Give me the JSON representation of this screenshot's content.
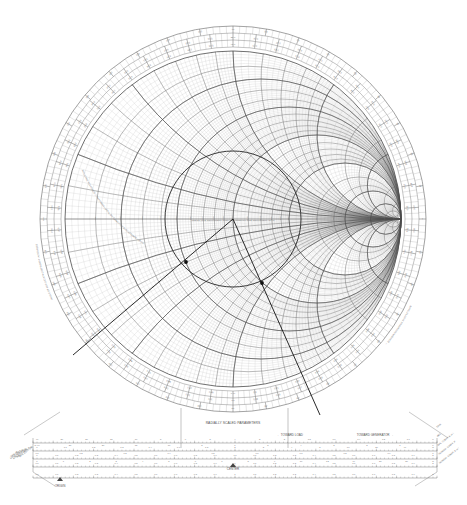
{
  "document": {
    "title": "Smith Chart",
    "kind": "impedance-admittance-smith-chart"
  },
  "chart": {
    "center_x": 233,
    "center_y": 219,
    "radius": 168,
    "outer_radius": 198,
    "name_left": "IMPEDANCE OR ADMITTANCE COORDINATES",
    "resistance_label": "RESISTANCE COMPONENT (R/Zo), OR CONDUCTANCE COMPONENT (G/Yo)",
    "reactance_label": "INDUCTIVE REACTANCE COMPONENT (+jX/Zo), OR CAPACITIVE SUSCEPTANCE (+jB/Yo)",
    "resistance_circles": [
      0.1,
      0.2,
      0.3,
      0.4,
      0.5,
      0.6,
      0.7,
      0.8,
      0.9,
      1.0,
      1.2,
      1.4,
      1.6,
      1.8,
      2.0,
      3.0,
      4.0,
      5.0,
      10.0,
      20.0,
      50.0
    ],
    "resistance_major": [
      0.2,
      0.5,
      1.0,
      2.0,
      5.0,
      10.0
    ],
    "reactance_arcs": [
      0.1,
      0.2,
      0.3,
      0.4,
      0.5,
      0.6,
      0.7,
      0.8,
      0.9,
      1.0,
      1.2,
      1.4,
      1.6,
      1.8,
      2.0,
      3.0,
      4.0,
      5.0,
      10.0,
      20.0,
      50.0
    ],
    "reactance_major": [
      0.2,
      0.5,
      1.0,
      2.0,
      5.0
    ],
    "axis_labels": [
      "0.1",
      "0.2",
      "0.3",
      "0.4",
      "0.5",
      "0.6",
      "0.7",
      "0.8",
      "0.9",
      "1.0",
      "1.2",
      "1.4",
      "1.6",
      "1.8",
      "2.0",
      "3.0",
      "4.0",
      "5.0",
      "10",
      "20",
      "50"
    ],
    "reactance_tick_labels": [
      "0.1",
      "0.2",
      "0.3",
      "0.4",
      "0.5",
      "0.6",
      "0.7",
      "0.8",
      "0.9",
      "1.0",
      "1.2",
      "1.4",
      "1.6",
      "1.8",
      "2.0",
      "3.0",
      "4.0",
      "5.0",
      "10",
      "20",
      "50"
    ]
  },
  "outer_rings": [
    {
      "name": "wavelengths-toward-generator",
      "label": "WAVELENGTHS TOWARD GENERATOR →",
      "range_min": 0.0,
      "range_max": 0.5,
      "major_step": 0.01,
      "labels": [
        "0.0",
        "0.01",
        "0.02",
        "0.03",
        "0.04",
        "0.05",
        "0.06",
        "0.07",
        "0.08",
        "0.09",
        "0.10",
        "0.11",
        "0.12",
        "0.13",
        "0.14",
        "0.15",
        "0.16",
        "0.17",
        "0.18",
        "0.19",
        "0.20",
        "0.21",
        "0.22",
        "0.23",
        "0.24",
        "0.25",
        "0.26",
        "0.27",
        "0.28",
        "0.29",
        "0.30",
        "0.31",
        "0.32",
        "0.33",
        "0.34",
        "0.35",
        "0.36",
        "0.37",
        "0.38",
        "0.39",
        "0.40",
        "0.41",
        "0.42",
        "0.43",
        "0.44",
        "0.45",
        "0.46",
        "0.47",
        "0.48",
        "0.49"
      ]
    },
    {
      "name": "wavelengths-toward-load",
      "label": "← WAVELENGTHS TOWARD LOAD",
      "range_min": 0.0,
      "range_max": 0.5,
      "major_step": 0.01,
      "labels": [
        "0.49",
        "0.48",
        "0.47",
        "0.46",
        "0.45",
        "0.44",
        "0.43",
        "0.42",
        "0.41",
        "0.40",
        "0.39",
        "0.38",
        "0.37",
        "0.36",
        "0.35",
        "0.34",
        "0.33",
        "0.32",
        "0.31",
        "0.30",
        "0.29",
        "0.28",
        "0.27",
        "0.26",
        "0.25",
        "0.24",
        "0.23",
        "0.22",
        "0.21",
        "0.20",
        "0.19",
        "0.18",
        "0.17",
        "0.16",
        "0.15",
        "0.14",
        "0.13",
        "0.12",
        "0.11",
        "0.10",
        "0.09",
        "0.08",
        "0.07",
        "0.06",
        "0.05",
        "0.04",
        "0.03",
        "0.02",
        "0.01",
        "0.0"
      ]
    },
    {
      "name": "angle-of-reflection-coefficient",
      "label": "ANGLE OF REFLECTION COEFFICIENT IN DEGREES",
      "range_min": -180,
      "range_max": 180,
      "major_step": 10,
      "labels": [
        "0",
        "10",
        "20",
        "30",
        "40",
        "50",
        "60",
        "70",
        "80",
        "90",
        "100",
        "110",
        "120",
        "130",
        "140",
        "150",
        "160",
        "170",
        "180",
        "-170",
        "-160",
        "-150",
        "-140",
        "-130",
        "-120",
        "-110",
        "-100",
        "-90",
        "-80",
        "-70",
        "-60",
        "-50",
        "-40",
        "-30",
        "-20",
        "-10"
      ]
    },
    {
      "name": "angle-of-transmission-coefficient",
      "label": "ANGLE OF TRANSMISSION COEFFICIENT IN DEGREES",
      "range_min": -180,
      "range_max": 180,
      "major_step": 10,
      "labels": [
        "0",
        "10",
        "20",
        "30",
        "40",
        "50",
        "60",
        "70",
        "80",
        "90",
        "100",
        "110",
        "120",
        "130",
        "140",
        "150",
        "160",
        "170",
        "180",
        "-170",
        "-160",
        "-150",
        "-140",
        "-130",
        "-120",
        "-110",
        "-100",
        "-90",
        "-80",
        "-70",
        "-60",
        "-50",
        "-40",
        "-30",
        "-20",
        "-10"
      ]
    }
  ],
  "radial_scales": {
    "title": "RADIALLY SCALED PARAMETERS",
    "toward_load": "← TOWARD LOAD",
    "toward_generator": "TOWARD GENERATOR →",
    "center_label": "CENTER",
    "origin_label": "ORIGIN",
    "left_labels": [
      "SWR dB",
      "LOSS COEF",
      "ATTEN [dB]",
      "RTN. LOSS [dB]",
      "RFL. COEFF, P",
      "RFL. LOSS [dB]"
    ],
    "right_labels": [
      "SWR",
      "dBS",
      "RFL. COEFF, E or I",
      "TRANSM. COEFF, P",
      "TRANSM. COEFF, E or I"
    ],
    "rows": [
      {
        "name": "swr-db-row",
        "left_tag": "← SWR dB",
        "ticks": [
          "40",
          "30",
          "20",
          "15",
          "10",
          "8",
          "6",
          "5",
          "4",
          "3",
          "2",
          "1.8",
          "1.6",
          "1.4",
          "1.2",
          "1.1",
          "1"
        ],
        "ticks2": [
          "∞ 40",
          "30",
          "20",
          "15",
          "10",
          "8",
          "6",
          "5",
          "4",
          "3",
          "2",
          "1",
          "0"
        ]
      },
      {
        "name": "loss-coef-row",
        "left_tag": "1",
        "ticks": [
          "1",
          "1.1",
          "1.2",
          "1.3",
          "1.4",
          "1.6",
          "1.8",
          "2",
          "3",
          "4",
          "5",
          "10",
          "20",
          "40",
          "∞"
        ],
        "ticks2": [
          "0.1",
          "0.2",
          "0.3",
          "0.4",
          "0.5",
          "0.6",
          "0.7",
          "0.8",
          "0.9",
          "1"
        ]
      },
      {
        "name": "rfl-coeff-row",
        "ticks": [
          "0",
          "0.1",
          "0.2",
          "0.3",
          "0.4",
          "0.5",
          "0.6",
          "0.7",
          "0.8",
          "0.9",
          "1.0",
          "1.1",
          "1.2",
          "1.3",
          "1.4",
          "1.5",
          "1.6",
          "1.7",
          "1.8",
          "1.9",
          "2"
        ],
        "ticks2": [
          "0",
          "1",
          "2",
          "3",
          "4",
          "5",
          "6",
          "7",
          "8",
          "9",
          "10",
          "12",
          "14",
          "20",
          "30",
          "∞"
        ]
      },
      {
        "name": "transm-coeff-row",
        "ticks": [
          "0.0",
          "0.1",
          "0.2",
          "0.3",
          "0.4",
          "0.5",
          "0.6",
          "0.7",
          "0.8",
          "0.9",
          "1",
          "1.1",
          "1.2",
          "1.3",
          "1.4",
          "1.5",
          "1.6",
          "1.7",
          "1.8",
          "1.9",
          "2"
        ],
        "ticks2": []
      }
    ]
  },
  "plot": {
    "vswr_circle": {
      "name": "constant-vswr-circle",
      "center_x": 233,
      "center_y": 219,
      "radius": 68,
      "color": "#222222"
    },
    "points": [
      {
        "name": "marker-z-load",
        "x": 186,
        "y": 262,
        "label": ""
      },
      {
        "name": "marker-z-rotated",
        "x": 262,
        "y": 283,
        "label": ""
      }
    ],
    "construction_lines": [
      {
        "name": "radial-line-1",
        "x1": 233,
        "y1": 219,
        "x2": 73,
        "y2": 355
      },
      {
        "name": "radial-line-2",
        "x1": 233,
        "y1": 219,
        "x2": 320,
        "y2": 415
      }
    ],
    "line_color": "#111111"
  },
  "colors": {
    "grid_minor": "#b9b9b9",
    "grid_major": "#6e6e6e",
    "axis": "#4a4a4a",
    "ring": "#7b7b7b",
    "text": "#666666",
    "plot": "#111111",
    "background": "#ffffff"
  }
}
